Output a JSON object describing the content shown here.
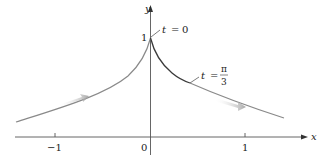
{
  "figure": {
    "axes": {
      "x_label": "x",
      "y_label": "y",
      "origin_label": "0",
      "x_ticks": [
        {
          "value": -1,
          "label": "−1"
        },
        {
          "value": 1,
          "label": "1"
        }
      ],
      "y_ticks": [
        {
          "value": 1,
          "label": "1"
        }
      ]
    },
    "annotations": [
      {
        "id": "t0",
        "var": "t",
        "eq": "=",
        "value": "0"
      },
      {
        "id": "tpi3",
        "var": "t",
        "eq": "=",
        "numerator": "π",
        "denominator": "3"
      }
    ],
    "curve": {
      "description": "Parametric curve with cusp at (0,1), decaying toward x-axis on both sides",
      "color": "#8a8a8a",
      "highlight_color": "#3a3a3a",
      "arrow_color": "#b0b0b0"
    },
    "direction_arrows": [
      {
        "side": "left",
        "direction": "right"
      },
      {
        "side": "right",
        "direction": "right"
      }
    ]
  }
}
